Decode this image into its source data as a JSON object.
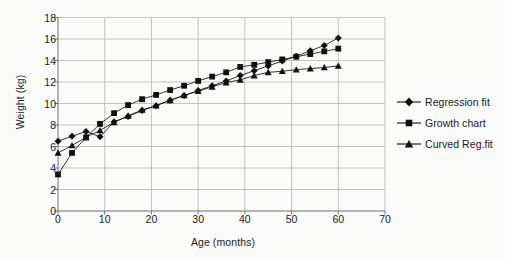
{
  "chart_data": {
    "type": "line",
    "title": "",
    "xlabel": "Age (months)",
    "ylabel": "Weight (kg)",
    "xlim": [
      0,
      70
    ],
    "ylim": [
      0,
      18
    ],
    "xticks": [
      0,
      10,
      20,
      30,
      40,
      50,
      60,
      70
    ],
    "yticks": [
      0,
      2,
      4,
      6,
      8,
      10,
      12,
      14,
      16,
      18
    ],
    "grid": true,
    "legend_position": "right",
    "x": [
      0,
      3,
      6,
      9,
      12,
      15,
      18,
      21,
      24,
      27,
      30,
      33,
      36,
      39,
      42,
      45,
      48,
      51,
      54,
      57,
      60
    ],
    "series": [
      {
        "name": "Regression fit",
        "marker": "diamond",
        "color": "#101010",
        "values": [
          6.5,
          6.95,
          7.4,
          6.9,
          8.3,
          8.8,
          9.35,
          9.8,
          10.3,
          10.75,
          11.2,
          11.65,
          12.1,
          12.6,
          13.05,
          13.5,
          13.95,
          14.4,
          14.9,
          15.4,
          16.1
        ]
      },
      {
        "name": "Growth chart",
        "marker": "square",
        "color": "#101010",
        "values": [
          3.4,
          5.4,
          6.85,
          8.1,
          9.1,
          9.85,
          10.4,
          10.8,
          11.25,
          11.65,
          12.1,
          12.5,
          12.9,
          13.4,
          13.6,
          13.85,
          14.1,
          14.35,
          14.6,
          14.85,
          15.1
        ]
      },
      {
        "name": "Curved Reg.fit",
        "marker": "triangle",
        "color": "#101010",
        "values": [
          5.4,
          6.1,
          6.85,
          7.5,
          8.25,
          8.85,
          9.4,
          9.8,
          10.3,
          10.75,
          11.15,
          11.55,
          11.95,
          12.2,
          12.6,
          12.9,
          13.0,
          13.15,
          13.25,
          13.35,
          13.5
        ]
      }
    ]
  },
  "legend": {
    "items": [
      {
        "label": "Regression fit"
      },
      {
        "label": "Growth chart"
      },
      {
        "label": "Curved Reg.fit"
      }
    ]
  }
}
